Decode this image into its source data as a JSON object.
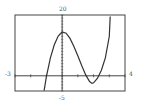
{
  "chart_data": {
    "type": "line",
    "title": "",
    "xlabel": "",
    "ylabel": "",
    "xlim": [
      -3,
      4
    ],
    "ylim": [
      -5,
      20
    ],
    "grid": false,
    "tick_labels": {
      "xmin": "-3",
      "xmax": "4",
      "ymax": "20",
      "ymin": "-5"
    },
    "x_ticks": [
      -3,
      -2,
      -1,
      0,
      1,
      2,
      3,
      4
    ],
    "y_tick_spacing": 1,
    "series": [
      {
        "name": "cubic",
        "description": "Cubic with local max ~14.4 at x=0, local min ~-2.5 near x=1.9, roots near -0.98, 1.46, 2.36",
        "x": [
          -1.15,
          -1.0,
          -0.75,
          -0.5,
          -0.25,
          0,
          0.25,
          0.5,
          0.75,
          1.0,
          1.25,
          1.5,
          1.75,
          1.9,
          2.0,
          2.25,
          2.5,
          2.75,
          3.0,
          3.06
        ],
        "values": [
          -4.9,
          -0.3,
          5.9,
          10.2,
          13.1,
          14.4,
          14.0,
          12.3,
          9.6,
          6.5,
          3.3,
          0.3,
          -1.9,
          -2.5,
          -2.3,
          -0.8,
          1.8,
          6.0,
          13.0,
          19.5
        ]
      }
    ],
    "frame": {
      "color": "#444444"
    },
    "curve_color": "#333333",
    "axis_color": "#444444"
  }
}
